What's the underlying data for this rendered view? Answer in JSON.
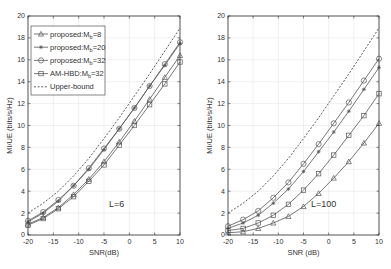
{
  "chart_data": [
    {
      "type": "line",
      "title": "",
      "annotation": "L=6",
      "xlabel": "SNR(dB)",
      "ylabel": "MI/UE (bits/s/Hz)",
      "xlim": [
        -20,
        10
      ],
      "ylim": [
        0,
        20
      ],
      "xticks": [
        -20,
        -15,
        -10,
        -5,
        0,
        5,
        10
      ],
      "yticks": [
        0,
        2,
        4,
        6,
        8,
        10,
        12,
        14,
        16,
        18,
        20
      ],
      "grid": true,
      "legend_position": "upper left",
      "x": [
        -20,
        -17,
        -14,
        -11,
        -8,
        -5,
        -2,
        1,
        4,
        7,
        10
      ],
      "series": [
        {
          "name": "proposed:M_b=8",
          "marker": "triangle",
          "linestyle": "solid",
          "values": [
            1.0,
            1.6,
            2.5,
            3.7,
            5.1,
            6.7,
            8.5,
            10.4,
            12.4,
            14.4,
            16.4
          ]
        },
        {
          "name": "proposed:M_b=20",
          "marker": "asterisk",
          "linestyle": "solid",
          "values": [
            1.2,
            2.0,
            3.1,
            4.5,
            6.0,
            7.8,
            9.7,
            11.6,
            13.6,
            15.5,
            17.5
          ]
        },
        {
          "name": "proposed:M_b=32",
          "marker": "circle",
          "linestyle": "solid",
          "values": [
            1.3,
            2.1,
            3.2,
            4.5,
            6.1,
            7.9,
            9.7,
            11.6,
            13.6,
            15.6,
            17.6
          ]
        },
        {
          "name": "AM-HBD:M_b=32",
          "marker": "square",
          "linestyle": "solid",
          "values": [
            0.9,
            1.5,
            2.4,
            3.5,
            4.9,
            6.4,
            8.2,
            10.0,
            11.9,
            13.8,
            15.8
          ]
        },
        {
          "name": "Upper-bound",
          "marker": "none",
          "linestyle": "dashed",
          "values": [
            2.0,
            2.9,
            4.0,
            5.4,
            7.0,
            8.8,
            10.7,
            12.7,
            14.7,
            16.8,
            18.9
          ]
        }
      ]
    },
    {
      "type": "line",
      "title": "",
      "annotation": "L=100",
      "xlabel": "SNR (dB)",
      "ylabel": "MI/UE (bits/s/Hz)",
      "xlim": [
        -20,
        10
      ],
      "ylim": [
        0,
        20
      ],
      "xticks": [
        -20,
        -15,
        -10,
        -5,
        0,
        5,
        10
      ],
      "yticks": [
        0,
        2,
        4,
        6,
        8,
        10,
        12,
        14,
        16,
        18,
        20
      ],
      "grid": true,
      "legend_position": "none",
      "x": [
        -20,
        -17,
        -14,
        -11,
        -8,
        -5,
        -2,
        1,
        4,
        7,
        10
      ],
      "series": [
        {
          "name": "proposed:M_b=8",
          "marker": "triangle",
          "linestyle": "solid",
          "values": [
            0.2,
            0.3,
            0.6,
            1.1,
            1.7,
            2.6,
            3.8,
            5.2,
            6.7,
            8.4,
            10.2
          ]
        },
        {
          "name": "proposed:M_b=20",
          "marker": "asterisk",
          "linestyle": "solid",
          "values": [
            0.6,
            1.1,
            1.8,
            2.9,
            4.2,
            5.8,
            7.6,
            9.4,
            11.3,
            13.3,
            15.3
          ]
        },
        {
          "name": "proposed:M_b=32",
          "marker": "circle",
          "linestyle": "solid",
          "values": [
            0.8,
            1.4,
            2.2,
            3.4,
            4.8,
            6.5,
            8.3,
            10.2,
            12.1,
            14.1,
            16.1
          ]
        },
        {
          "name": "AM-HBD:M_b=32",
          "marker": "square",
          "linestyle": "solid",
          "values": [
            0.4,
            0.6,
            1.1,
            1.8,
            2.8,
            4.1,
            5.6,
            7.3,
            9.1,
            10.9,
            12.9
          ]
        },
        {
          "name": "Upper-bound",
          "marker": "none",
          "linestyle": "dashed",
          "values": [
            2.0,
            2.9,
            4.0,
            5.4,
            7.0,
            8.8,
            10.7,
            12.7,
            14.7,
            16.8,
            18.9
          ]
        }
      ]
    }
  ],
  "legend": {
    "entries": [
      {
        "label": "proposed:M",
        "sub": "b",
        "suffix": "=8",
        "marker": "triangle",
        "linestyle": "solid"
      },
      {
        "label": "proposed:M",
        "sub": "b",
        "suffix": "=20",
        "marker": "asterisk",
        "linestyle": "solid"
      },
      {
        "label": "proposed:M",
        "sub": "b",
        "suffix": "=32",
        "marker": "circle",
        "linestyle": "solid"
      },
      {
        "label": "AM-HBD:M",
        "sub": "b",
        "suffix": "=32",
        "marker": "square",
        "linestyle": "solid"
      },
      {
        "label": "Upper-bound",
        "sub": "",
        "suffix": "",
        "marker": "none",
        "linestyle": "dashed"
      }
    ]
  },
  "colors": {
    "line": "#555555",
    "dashed": "#333333",
    "axis": "#333333",
    "grid": "#e6e6e6"
  }
}
